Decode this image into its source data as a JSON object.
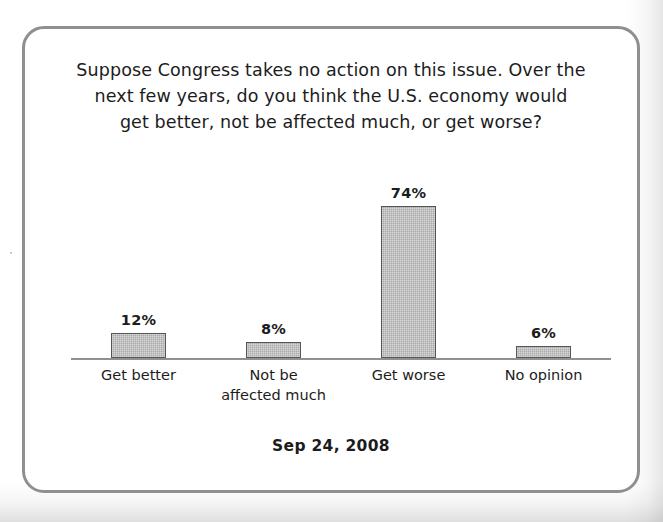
{
  "figure": {
    "title_lines": [
      "Suppose Congress takes no action on this issue. Over the",
      "next few years, do you think the U.S. economy would",
      "get better, not be affected much, or get worse?"
    ],
    "footnote": "Sep 24, 2008"
  },
  "chart_data": {
    "type": "bar",
    "title": "Suppose Congress takes no action on this issue. Over the next few years, do you think the U.S. economy would get better, not be affected much, or get worse?",
    "subtitle": "Sep 24, 2008",
    "categories": [
      "Get better",
      "Not be affected much",
      "Get worse",
      "No opinion"
    ],
    "category_lines": [
      [
        "Get better"
      ],
      [
        "Not be",
        "affected much"
      ],
      [
        "Get worse"
      ],
      [
        "No opinion"
      ]
    ],
    "values": [
      12,
      8,
      74,
      6
    ],
    "value_labels": [
      "12%",
      "8%",
      "74%",
      "6%"
    ],
    "xlabel": "",
    "ylabel": "",
    "ylim": [
      0,
      100
    ],
    "grid": false,
    "legend": "none",
    "units": "percent",
    "bar_fill_color": "#b2b2b2",
    "bar_border_color": "#555555",
    "axis_color": "#909090",
    "text_color": "#1c1c1c",
    "frame_color": "#8f8f8f"
  }
}
